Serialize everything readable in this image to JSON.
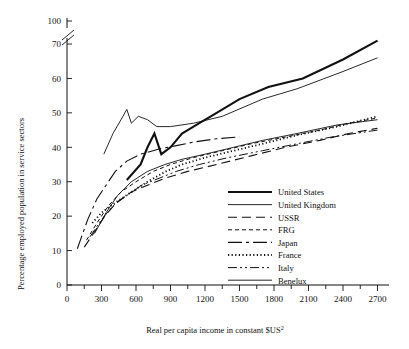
{
  "chart_data": {
    "type": "line",
    "title": "",
    "xlabel": "Real per capita income in constant $US2",
    "xlabel_main": "Real per capita income in constant $US",
    "xlabel_superscript": "2",
    "ylabel": "Percentage employed population in service sectors",
    "xlim": [
      0,
      2800
    ],
    "ylim": [
      0,
      75
    ],
    "grid": false,
    "legend_position": "inside-lower-right",
    "axis_break": {
      "present": true,
      "between": [
        70,
        100
      ],
      "style": "double-slash"
    },
    "xticks": [
      0,
      300,
      600,
      900,
      1200,
      1500,
      1800,
      2100,
      2400,
      2700
    ],
    "xtick_labels": [
      "0",
      "300",
      "600",
      "900",
      "1200",
      "1500",
      "1800",
      "2100",
      "2400",
      "2700"
    ],
    "xminor_ticks": [
      150,
      450,
      750,
      1050,
      1350,
      1650,
      1950,
      2250,
      2550
    ],
    "yticks": [
      0,
      10,
      20,
      30,
      40,
      50,
      60,
      70,
      100
    ],
    "ytick_labels": [
      "0",
      "10",
      "20",
      "30",
      "40",
      "50",
      "60",
      "70",
      "100"
    ],
    "series": [
      {
        "name": "United States",
        "style": "solid-thick",
        "width": 2.1,
        "dash": "",
        "points": [
          [
            520,
            30.5
          ],
          [
            640,
            35
          ],
          [
            700,
            40
          ],
          [
            760,
            44
          ],
          [
            820,
            38
          ],
          [
            900,
            40
          ],
          [
            1000,
            44
          ],
          [
            1150,
            47
          ],
          [
            1250,
            49
          ],
          [
            1500,
            54
          ],
          [
            1750,
            57.5
          ],
          [
            2050,
            60
          ],
          [
            2400,
            65.5
          ],
          [
            2700,
            71
          ]
        ]
      },
      {
        "name": "United Kingdom",
        "style": "solid-thin",
        "width": 0.9,
        "dash": "",
        "points": [
          [
            320,
            38
          ],
          [
            400,
            44
          ],
          [
            470,
            48
          ],
          [
            520,
            51
          ],
          [
            560,
            47
          ],
          [
            620,
            49
          ],
          [
            700,
            48
          ],
          [
            780,
            46
          ],
          [
            900,
            46
          ],
          [
            1100,
            47
          ],
          [
            1350,
            49
          ],
          [
            1700,
            54
          ],
          [
            2000,
            57
          ],
          [
            2400,
            62
          ],
          [
            2700,
            66
          ]
        ]
      },
      {
        "name": "USSR",
        "style": "dashed-long",
        "width": 1.1,
        "dash": "9,5",
        "points": [
          [
            150,
            11
          ],
          [
            250,
            16
          ],
          [
            330,
            20
          ],
          [
            430,
            24
          ],
          [
            560,
            27
          ],
          [
            700,
            29
          ],
          [
            850,
            31
          ],
          [
            1050,
            33
          ],
          [
            1300,
            35
          ],
          [
            1600,
            37.5
          ],
          [
            1900,
            40
          ],
          [
            2200,
            42
          ],
          [
            2450,
            44
          ],
          [
            2700,
            45.5
          ]
        ]
      },
      {
        "name": "FRG",
        "style": "dashed-short",
        "width": 1.0,
        "dash": "4,3",
        "points": [
          [
            170,
            13
          ],
          [
            260,
            18
          ],
          [
            360,
            23
          ],
          [
            470,
            27
          ],
          [
            600,
            30
          ],
          [
            750,
            33
          ],
          [
            900,
            35
          ],
          [
            1100,
            37
          ],
          [
            1350,
            39
          ],
          [
            1600,
            41
          ],
          [
            1900,
            43
          ],
          [
            2200,
            45
          ],
          [
            2450,
            47
          ],
          [
            2700,
            48.5
          ]
        ]
      },
      {
        "name": "Japan",
        "style": "dash-dot",
        "width": 1.1,
        "dash": "14,4,3,4",
        "points": [
          [
            90,
            10.5
          ],
          [
            180,
            19
          ],
          [
            260,
            25
          ],
          [
            340,
            29
          ],
          [
            420,
            33
          ],
          [
            520,
            36
          ],
          [
            640,
            38
          ],
          [
            800,
            39.5
          ],
          [
            950,
            40.5
          ],
          [
            1100,
            41.5
          ],
          [
            1300,
            42.5
          ],
          [
            1500,
            43
          ]
        ]
      },
      {
        "name": "France",
        "style": "dotted",
        "width": 1.8,
        "dash": "1.2,2.4",
        "points": [
          [
            220,
            18
          ],
          [
            300,
            21
          ],
          [
            380,
            23
          ],
          [
            470,
            25
          ],
          [
            560,
            27
          ],
          [
            700,
            30
          ],
          [
            860,
            33
          ],
          [
            1000,
            35
          ],
          [
            1200,
            37
          ],
          [
            1450,
            39
          ],
          [
            1700,
            41
          ],
          [
            2000,
            43.5
          ],
          [
            2350,
            46
          ],
          [
            2700,
            49
          ]
        ]
      },
      {
        "name": "Italy",
        "style": "dash-dot-dot",
        "width": 1.0,
        "dash": "9,3,2,3,2,3",
        "points": [
          [
            200,
            14
          ],
          [
            300,
            19
          ],
          [
            400,
            23
          ],
          [
            520,
            26
          ],
          [
            650,
            29
          ],
          [
            800,
            31
          ],
          [
            950,
            33
          ],
          [
            1150,
            35
          ],
          [
            1400,
            37
          ],
          [
            1700,
            39
          ],
          [
            2000,
            41
          ],
          [
            2300,
            43
          ],
          [
            2700,
            45
          ]
        ]
      },
      {
        "name": "Benelux",
        "style": "solid-thin",
        "width": 0.9,
        "dash": "",
        "points": [
          [
            240,
            15
          ],
          [
            340,
            21
          ],
          [
            440,
            26
          ],
          [
            560,
            30
          ],
          [
            700,
            33
          ],
          [
            850,
            35
          ],
          [
            1000,
            36.5
          ],
          [
            1200,
            38
          ],
          [
            1450,
            40
          ],
          [
            1700,
            42
          ],
          [
            2000,
            44
          ],
          [
            2350,
            46.5
          ],
          [
            2700,
            48
          ]
        ]
      }
    ]
  },
  "legend": {
    "entries": [
      {
        "label": "United States"
      },
      {
        "label": "United Kingdom"
      },
      {
        "label": "USSR"
      },
      {
        "label": "FRG"
      },
      {
        "label": "Japan"
      },
      {
        "label": "France"
      },
      {
        "label": "Italy"
      },
      {
        "label": "Benelux"
      }
    ]
  }
}
